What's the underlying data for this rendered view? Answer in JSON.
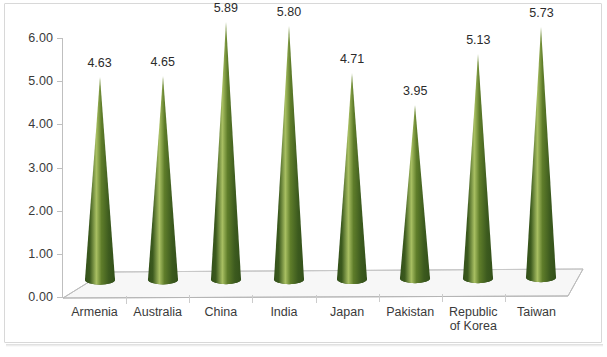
{
  "chart_data": {
    "type": "bar",
    "title": "",
    "subtitle": "",
    "xlabel": "",
    "ylabel": "",
    "categories": [
      "Armenia",
      "Australia",
      "China",
      "India",
      "Japan",
      "Pakistan",
      "Republic of Korea",
      "Taiwan"
    ],
    "values": [
      4.63,
      4.65,
      5.89,
      5.8,
      4.71,
      3.95,
      5.13,
      5.73
    ],
    "data_labels": [
      "4.63",
      "4.65",
      "5.89",
      "5.80",
      "4.71",
      "3.95",
      "5.13",
      "5.73"
    ],
    "ylim": [
      0,
      6
    ],
    "y_tick_step": 1,
    "y_tick_labels": [
      "0.00",
      "1.00",
      "2.00",
      "3.00",
      "4.00",
      "5.00",
      "6.00"
    ],
    "grid": false,
    "legend": null,
    "legend_position": "none",
    "series": [
      {
        "name": "",
        "values": [
          4.63,
          4.65,
          5.89,
          5.8,
          4.71,
          3.95,
          5.13,
          5.73
        ]
      }
    ],
    "marker_shape": "cone-3d",
    "colors": {
      "cone_dark": "#3c5a1e",
      "cone_mid": "#5f7d2a",
      "cone_light": "#a8bf62",
      "cone_edge": "#33501a",
      "axis": "#bfbfbf",
      "floor": "#f4f4f4",
      "floor_edge": "#b5b5b5",
      "text": "#3a3a3a",
      "border": "#d8d8d8",
      "background": "#ffffff"
    }
  },
  "axis": {
    "y_labels": [
      "6.00",
      "5.00",
      "4.00",
      "3.00",
      "2.00",
      "1.00",
      "0.00"
    ],
    "x_labels": [
      "Armenia",
      "Australia",
      "China",
      "India",
      "Japan",
      "Pakistan",
      "Republic\nof Korea",
      "Taiwan"
    ]
  }
}
